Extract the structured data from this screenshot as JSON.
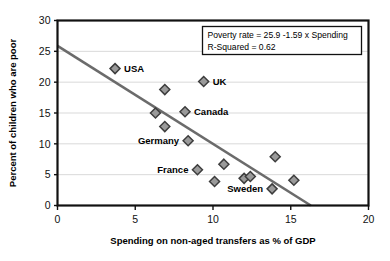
{
  "chart_data": {
    "type": "scatter",
    "title": "",
    "xlabel": "Spending on non-aged transfers as % of GDP",
    "ylabel": "Percent of children who are poor",
    "xlim": [
      0,
      20
    ],
    "ylim": [
      0,
      30
    ],
    "xticks": [
      "0",
      "5",
      "10",
      "15",
      "20"
    ],
    "yticks": [
      "0",
      "5",
      "10",
      "15",
      "20",
      "25",
      "30"
    ],
    "grid": "horizontal",
    "legend": "none",
    "points": [
      {
        "x": 3.7,
        "y": 22.2,
        "label": "USA",
        "label_pos": "right"
      },
      {
        "x": 6.3,
        "y": 15.0,
        "label": "",
        "label_pos": "right"
      },
      {
        "x": 6.9,
        "y": 18.8,
        "label": "",
        "label_pos": "right"
      },
      {
        "x": 6.9,
        "y": 12.8,
        "label": "",
        "label_pos": "right"
      },
      {
        "x": 8.2,
        "y": 15.2,
        "label": "Canada",
        "label_pos": "right"
      },
      {
        "x": 8.4,
        "y": 10.5,
        "label": "Germany",
        "label_pos": "left"
      },
      {
        "x": 9.0,
        "y": 5.8,
        "label": "France",
        "label_pos": "left"
      },
      {
        "x": 9.4,
        "y": 20.1,
        "label": "UK",
        "label_pos": "right"
      },
      {
        "x": 10.1,
        "y": 3.9,
        "label": "",
        "label_pos": "right"
      },
      {
        "x": 10.7,
        "y": 6.7,
        "label": "",
        "label_pos": "right"
      },
      {
        "x": 12.0,
        "y": 4.4,
        "label": "",
        "label_pos": "right"
      },
      {
        "x": 12.4,
        "y": 4.7,
        "label": "",
        "label_pos": "right"
      },
      {
        "x": 13.8,
        "y": 2.7,
        "label": "Sweden",
        "label_pos": "left"
      },
      {
        "x": 14.0,
        "y": 7.9,
        "label": "",
        "label_pos": "right"
      },
      {
        "x": 15.2,
        "y": 4.1,
        "label": "",
        "label_pos": "right"
      }
    ],
    "trendline": {
      "intercept": 25.9,
      "slope": -1.59,
      "x_start": 0,
      "x_end": 16.29
    },
    "annotation": {
      "line1": "Poverty rate = 25.9 -1.59 x Spending",
      "line2": "R-Squared = 0.62"
    },
    "colors": {
      "marker_fill": "#9a9a9a",
      "marker_stroke": "#3d3d3d",
      "trendline": "#6b6b6b",
      "frame": "#111111",
      "gridline": "#d9d9d9",
      "text": "#000000"
    }
  }
}
